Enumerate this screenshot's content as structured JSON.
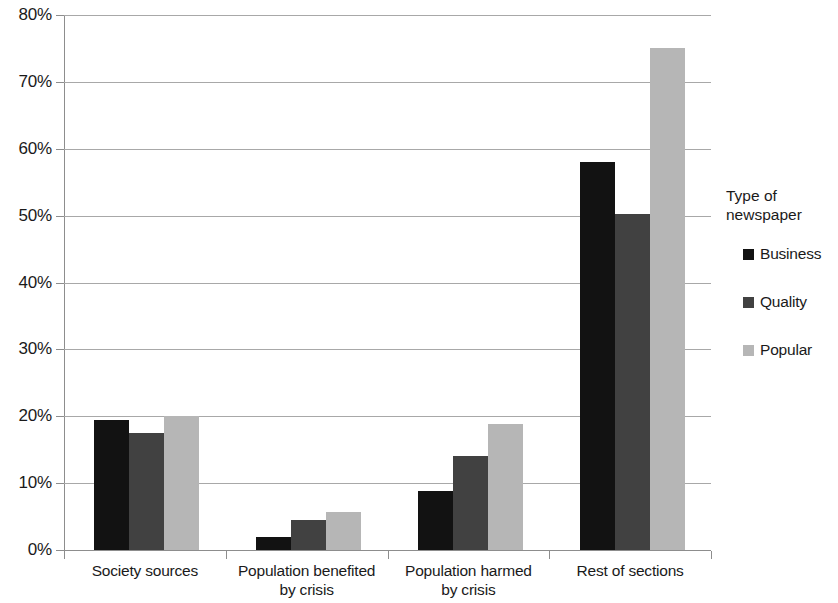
{
  "chart_data": {
    "type": "bar",
    "title": "",
    "xlabel": "",
    "ylabel": "",
    "ylim": [
      0,
      80
    ],
    "grid": true,
    "legend_position": "right",
    "ytick_labels": [
      "80%",
      "70%",
      "60%",
      "50%",
      "40%",
      "30%",
      "20%",
      "10%",
      "0%"
    ],
    "ytick_values": [
      80,
      70,
      60,
      50,
      40,
      30,
      20,
      10,
      0
    ],
    "categories": [
      "Society sources",
      "Population benefited\nby crisis",
      "Population harmed\nby crisis",
      "Rest of sections"
    ],
    "legend_title": "Type of\nnewspaper",
    "series": [
      {
        "name": "Business",
        "color": "#121212",
        "values": [
          19.5,
          2.0,
          8.8,
          58.0
        ]
      },
      {
        "name": "Quality",
        "color": "#414141",
        "values": [
          17.5,
          4.5,
          14.0,
          50.2
        ]
      },
      {
        "name": "Popular",
        "color": "#b6b6b6",
        "values": [
          20.0,
          5.7,
          18.8,
          75.0
        ]
      }
    ]
  }
}
